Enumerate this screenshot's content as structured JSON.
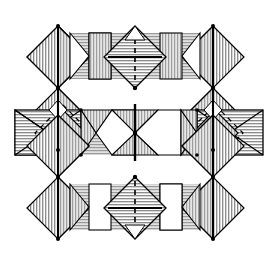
{
  "figure": {
    "title": "",
    "kind": "crystal-structure-polyhedral-diagram",
    "background_color": "#ffffff",
    "stroke_color": "#000000",
    "hatch_fill_color": "#b9b9b9",
    "band_fill_color": "#cfcfcf",
    "white_fill_color": "#ffffff",
    "canvas": {
      "width": 277,
      "height": 260
    }
  },
  "geometry": {
    "columns_x": [
      27,
      58,
      89,
      120,
      151,
      182,
      213,
      244
    ],
    "axis_columns_x": [
      58,
      120,
      182,
      244
    ],
    "rows_y": [
      26,
      57,
      88,
      110,
      133,
      155,
      177,
      208,
      239
    ],
    "bands": [
      {
        "name": "top-band",
        "x": 70,
        "y": 33,
        "width": 130,
        "height": 46,
        "hatch": "horizontal"
      },
      {
        "name": "middle-band",
        "x": 15,
        "y": 110,
        "width": 248,
        "height": 45,
        "hatch": "horizontal"
      },
      {
        "name": "bottom-band",
        "x": 70,
        "y": 184,
        "width": 130,
        "height": 46,
        "hatch": "horizontal"
      }
    ],
    "marker_crosses": [
      {
        "name": "cross-top",
        "cx": 135,
        "cy": 56,
        "half": 26,
        "vertical_style": "dashed",
        "horizontal_style": "solid"
      },
      {
        "name": "cross-bottom",
        "cx": 135,
        "cy": 207,
        "half": 26,
        "vertical_style": "dashed",
        "horizontal_style": "solid"
      }
    ],
    "dashed_squares": [
      {
        "name": "dashed-square-left",
        "cx": 63,
        "cy": 133,
        "half": 28
      },
      {
        "name": "dashed-square-right",
        "cx": 207,
        "cy": 133,
        "half": 28
      }
    ],
    "axis_lines": [
      {
        "name": "axis-left-upper",
        "x": 58,
        "y1": 26,
        "y2": 88
      },
      {
        "name": "axis-right-upper",
        "x": 213,
        "y1": 26,
        "y2": 88
      },
      {
        "name": "axis-center",
        "x": 135,
        "y1": 105,
        "y2": 160
      },
      {
        "name": "axis-left-lower",
        "x": 58,
        "y1": 177,
        "y2": 239
      },
      {
        "name": "axis-right-lower",
        "x": 213,
        "y1": 177,
        "y2": 239
      }
    ]
  },
  "legend": {
    "items": []
  },
  "annotations": []
}
